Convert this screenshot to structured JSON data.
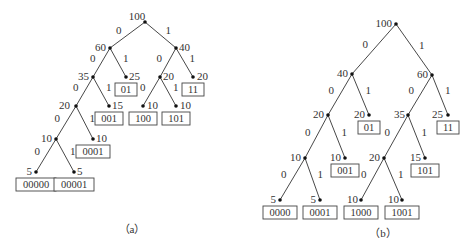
{
  "figure": {
    "trees": [
      {
        "id": "a",
        "caption": "（a）",
        "nodes": [
          {
            "id": "a_n100",
            "value": "100",
            "x": 145,
            "y": 22,
            "lx": -8,
            "ly": -5,
            "anchor": "middle"
          },
          {
            "id": "a_n60",
            "value": "60",
            "x": 110,
            "y": 48,
            "lx": -4,
            "ly": 0,
            "anchor": "end"
          },
          {
            "id": "a_n40",
            "value": "40",
            "x": 176,
            "y": 48,
            "lx": 3,
            "ly": 0,
            "anchor": "start"
          },
          {
            "id": "a_n35",
            "value": "35",
            "x": 93,
            "y": 77,
            "lx": -4,
            "ly": 0,
            "anchor": "end"
          },
          {
            "id": "a_n25",
            "value": "25",
            "x": 126,
            "y": 77,
            "lx": 3,
            "ly": 0,
            "anchor": "start",
            "code": "01"
          },
          {
            "id": "a_n20b",
            "value": "20",
            "x": 160,
            "y": 77,
            "lx": 3,
            "ly": 0,
            "anchor": "start"
          },
          {
            "id": "a_n20c",
            "value": "20",
            "x": 193,
            "y": 77,
            "lx": 4,
            "ly": 0,
            "anchor": "start",
            "code": "11"
          },
          {
            "id": "a_n20",
            "value": "20",
            "x": 76,
            "y": 106,
            "lx": -6,
            "ly": 0,
            "anchor": "end"
          },
          {
            "id": "a_n15",
            "value": "15",
            "x": 109,
            "y": 106,
            "lx": 3,
            "ly": 0,
            "anchor": "start",
            "code": "001"
          },
          {
            "id": "a_n10c",
            "value": "10",
            "x": 143,
            "y": 106,
            "lx": 4,
            "ly": 0,
            "anchor": "start",
            "code": "100"
          },
          {
            "id": "a_n10d",
            "value": "10",
            "x": 176,
            "y": 106,
            "lx": 4,
            "ly": 0,
            "anchor": "start",
            "code": "101"
          },
          {
            "id": "a_n10",
            "value": "10",
            "x": 56,
            "y": 139,
            "lx": -4,
            "ly": 0,
            "anchor": "end"
          },
          {
            "id": "a_n10b",
            "value": "10",
            "x": 93,
            "y": 139,
            "lx": 3,
            "ly": 0,
            "anchor": "start",
            "code": "0001"
          },
          {
            "id": "a_n5a",
            "value": "5",
            "x": 36,
            "y": 172,
            "lx": -4,
            "ly": 0,
            "anchor": "end",
            "code": "00000"
          },
          {
            "id": "a_n5b",
            "value": "5",
            "x": 74,
            "y": 172,
            "lx": 3,
            "ly": 0,
            "anchor": "start",
            "code": "00001"
          }
        ],
        "edges": [
          {
            "from": "a_n100",
            "to": "a_n60",
            "bit": "0"
          },
          {
            "from": "a_n100",
            "to": "a_n40",
            "bit": "1"
          },
          {
            "from": "a_n60",
            "to": "a_n35",
            "bit": "0"
          },
          {
            "from": "a_n60",
            "to": "a_n25",
            "bit": "1"
          },
          {
            "from": "a_n40",
            "to": "a_n20b",
            "bit": "0"
          },
          {
            "from": "a_n40",
            "to": "a_n20c",
            "bit": "1"
          },
          {
            "from": "a_n35",
            "to": "a_n20",
            "bit": "0"
          },
          {
            "from": "a_n35",
            "to": "a_n15",
            "bit": "1"
          },
          {
            "from": "a_n20b",
            "to": "a_n10c",
            "bit": "0"
          },
          {
            "from": "a_n20b",
            "to": "a_n10d",
            "bit": "1"
          },
          {
            "from": "a_n20",
            "to": "a_n10",
            "bit": "0"
          },
          {
            "from": "a_n20",
            "to": "a_n10b",
            "bit": "1"
          },
          {
            "from": "a_n10",
            "to": "a_n5a",
            "bit": "0"
          },
          {
            "from": "a_n10",
            "to": "a_n5b",
            "bit": "1"
          }
        ],
        "caption_pos": {
          "x": 132,
          "y": 233
        }
      },
      {
        "id": "b",
        "caption": "（b）",
        "nodes": [
          {
            "id": "b_n100",
            "value": "100",
            "x": 396,
            "y": 24,
            "lx": -4,
            "ly": 0,
            "anchor": "end"
          },
          {
            "id": "b_n40",
            "value": "40",
            "x": 352,
            "y": 74,
            "lx": -4,
            "ly": 0,
            "anchor": "end"
          },
          {
            "id": "b_n60",
            "value": "60",
            "x": 432,
            "y": 75,
            "lx": -4,
            "ly": 0,
            "anchor": "end"
          },
          {
            "id": "b_n20a",
            "value": "20",
            "x": 328,
            "y": 115,
            "lx": -4,
            "ly": 0,
            "anchor": "end"
          },
          {
            "id": "b_n20b",
            "value": "20",
            "x": 369,
            "y": 115,
            "lx": -4,
            "ly": 0,
            "anchor": "end",
            "code": "01"
          },
          {
            "id": "b_n35",
            "value": "35",
            "x": 408,
            "y": 115,
            "lx": -3,
            "ly": 0,
            "anchor": "end"
          },
          {
            "id": "b_n25",
            "value": "25",
            "x": 448,
            "y": 115,
            "lx": -5,
            "ly": 0,
            "anchor": "end",
            "code": "11"
          },
          {
            "id": "b_n10a",
            "value": "10",
            "x": 305,
            "y": 158,
            "lx": -4,
            "ly": 0,
            "anchor": "end"
          },
          {
            "id": "b_n10b",
            "value": "10",
            "x": 345,
            "y": 158,
            "lx": -4,
            "ly": 0,
            "anchor": "end",
            "code": "001"
          },
          {
            "id": "b_n20c",
            "value": "20",
            "x": 384,
            "y": 158,
            "lx": -4,
            "ly": 0,
            "anchor": "end"
          },
          {
            "id": "b_n15",
            "value": "15",
            "x": 425,
            "y": 158,
            "lx": -4,
            "ly": 0,
            "anchor": "end",
            "code": "101"
          },
          {
            "id": "b_n5a",
            "value": "5",
            "x": 280,
            "y": 200,
            "lx": -4,
            "ly": 0,
            "anchor": "end",
            "code": "0000"
          },
          {
            "id": "b_n5b",
            "value": "5",
            "x": 320,
            "y": 200,
            "lx": -4,
            "ly": 0,
            "anchor": "end",
            "code": "0001"
          },
          {
            "id": "b_n10c",
            "value": "10",
            "x": 361,
            "y": 200,
            "lx": -3,
            "ly": 0,
            "anchor": "end",
            "code": "1000"
          },
          {
            "id": "b_n10d",
            "value": "10",
            "x": 402,
            "y": 200,
            "lx": -3,
            "ly": 0,
            "anchor": "end",
            "code": "1001"
          }
        ],
        "edges": [
          {
            "from": "b_n100",
            "to": "b_n40",
            "bit": "0"
          },
          {
            "from": "b_n100",
            "to": "b_n60",
            "bit": "1"
          },
          {
            "from": "b_n40",
            "to": "b_n20a",
            "bit": "0"
          },
          {
            "from": "b_n40",
            "to": "b_n20b",
            "bit": "1"
          },
          {
            "from": "b_n60",
            "to": "b_n35",
            "bit": "0"
          },
          {
            "from": "b_n60",
            "to": "b_n25",
            "bit": "1"
          },
          {
            "from": "b_n20a",
            "to": "b_n10a",
            "bit": "0"
          },
          {
            "from": "b_n20a",
            "to": "b_n10b",
            "bit": "1"
          },
          {
            "from": "b_n35",
            "to": "b_n20c",
            "bit": "0"
          },
          {
            "from": "b_n35",
            "to": "b_n15",
            "bit": "1"
          },
          {
            "from": "b_n10a",
            "to": "b_n5a",
            "bit": "0"
          },
          {
            "from": "b_n10a",
            "to": "b_n5b",
            "bit": "1"
          },
          {
            "from": "b_n20c",
            "to": "b_n10c",
            "bit": "0"
          },
          {
            "from": "b_n20c",
            "to": "b_n10d",
            "bit": "1"
          }
        ],
        "caption_pos": {
          "x": 383,
          "y": 237
        }
      }
    ]
  }
}
